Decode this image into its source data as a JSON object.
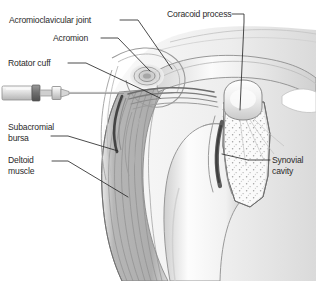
{
  "figure": {
    "width": 316,
    "height": 281,
    "background_color": "#ffffff",
    "line_color": "#2b2b2b",
    "text_color": "#2b2b2b",
    "style": "grayscale medical line illustration"
  },
  "labels": {
    "acromioclavicular_joint": "Acromioclavicular joint",
    "acromion": "Acromion",
    "rotator_cuff": "Rotator cuff",
    "subacromial_bursa_line1": "Subacromial",
    "subacromial_bursa_line2": "bursa",
    "deltoid_line1": "Deltoid",
    "deltoid_line2": "muscle",
    "coracoid_process": "Coracoid process",
    "synovial_line1": "Synovial",
    "synovial_line2": "cavity"
  },
  "structures": {
    "syringe": "syringe-with-needle",
    "clavicle": "clavicle",
    "acromion_bone": "acromion-process",
    "coracoid": "coracoid-process",
    "humerus_head": "humeral-head",
    "humerus_shaft": "humeral-shaft",
    "scapula": "scapula-glenoid",
    "deltoid_muscle": "deltoid-muscle",
    "synovial_cavity": "synovial-cavity",
    "subacromial_bursa": "subacromial-bursa"
  },
  "colors": {
    "bone_light": "#f2f2f2",
    "bone_mid": "#dcdcdc",
    "bone_shadow": "#b9b9b9",
    "muscle_fill": "#b8b8b8",
    "muscle_stripe": "#8d8d8d",
    "cavity_dark": "#5a5a5a",
    "outline": "#4a4a4a",
    "tissue_pale": "#eaeaea"
  }
}
